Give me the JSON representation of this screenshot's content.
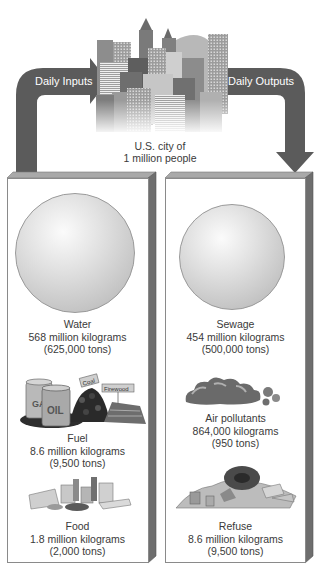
{
  "diagram": {
    "type": "urban-metabolism",
    "city": {
      "caption_line1": "U.S. city of",
      "caption_line2": "1 million people"
    },
    "arrows": {
      "inputs_label": "Daily Inputs",
      "outputs_label": "Daily Outputs"
    },
    "inputs": [
      {
        "name": "Water",
        "amount": "568 million kilograms",
        "tons": "(625,000 tons)",
        "icon": "sphere-icon"
      },
      {
        "name": "Fuel",
        "amount": "8.6 million kilograms",
        "tons": "(9,500 tons)",
        "icon": "fuel-icon",
        "sub_labels": [
          "GAS",
          "OIL",
          "Coal",
          "Firewood"
        ]
      },
      {
        "name": "Food",
        "amount": "1.8 million kilograms",
        "tons": "(2,000 tons)",
        "icon": "food-icon"
      }
    ],
    "outputs": [
      {
        "name": "Sewage",
        "amount": "454 million kilograms",
        "tons": "(500,000 tons)",
        "icon": "sphere-icon"
      },
      {
        "name": "Air pollutants",
        "amount": "864,000 kilograms",
        "tons": "(950 tons)",
        "icon": "smoke-cloud-icon"
      },
      {
        "name": "Refuse",
        "amount": "8.6 million kilograms",
        "tons": "(9,500 tons)",
        "icon": "refuse-pile-icon"
      }
    ],
    "colors": {
      "arrow": "#5a5a5a",
      "panel_side": "#6e6e6e",
      "panel_top": "#a8a8a8",
      "text": "#3a3a3a"
    }
  }
}
